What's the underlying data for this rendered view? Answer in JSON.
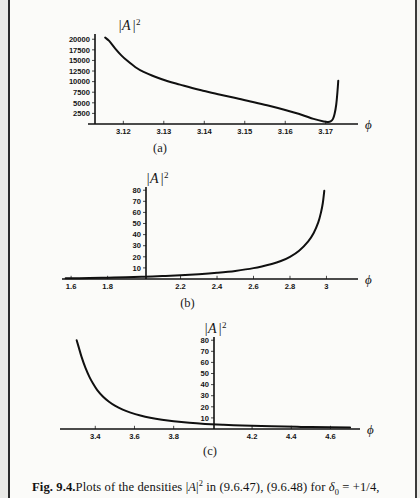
{
  "caption": {
    "figure_label": "Fig. 9.4.",
    "text_part1": "Plots of the densities ",
    "math_A": "A",
    "math_exp": "2",
    "text_part2": " in (9.6.47), (9.6.48) for ",
    "math_delta": "δ",
    "math_delta_sub": "0",
    "math_eq": " = +1/4,",
    "full_text": "Fig. 9.4. Plots of the densities |A|2 in (9.6.47), (9.6.48) for δ0 = +1/4,"
  },
  "subplots": [
    {
      "id": "a",
      "label": "(a)"
    },
    {
      "id": "b",
      "label": "(b)"
    },
    {
      "id": "c",
      "label": "(c)"
    }
  ],
  "axis_symbols": {
    "y_bar_left": "|",
    "y_A": "A",
    "y_bar_right": "|",
    "y_exponent": "2",
    "x_phi": "ϕ"
  },
  "chart_data": [
    {
      "type": "line",
      "id": "a",
      "title": "(a)",
      "xlabel": "ϕ",
      "ylabel": "|A|^2",
      "xlim": [
        3.113,
        3.176
      ],
      "ylim": [
        0,
        21000
      ],
      "xticks": [
        3.12,
        3.13,
        3.14,
        3.15,
        3.16,
        3.17
      ],
      "xtick_labels": [
        "3.12",
        "3.13",
        "3.14",
        "3.15",
        "3.16",
        "3.17"
      ],
      "yticks": [
        2500,
        5000,
        7500,
        10000,
        12500,
        15000,
        17500,
        20000
      ],
      "ytick_labels": [
        "2500",
        "5000",
        "7500",
        "10000",
        "12500",
        "15000",
        "17500",
        "20000"
      ],
      "grid": false,
      "legend": "none",
      "series": [
        {
          "name": "|A|^2 density",
          "x": [
            3.1155,
            3.1165,
            3.118,
            3.1195,
            3.121,
            3.123,
            3.125,
            3.128,
            3.131,
            3.134,
            3.137,
            3.14,
            3.144,
            3.148,
            3.152,
            3.156,
            3.16,
            3.164,
            3.167,
            3.1695,
            3.1705,
            3.1712,
            3.1718,
            3.1722,
            3.1726,
            3.1729,
            3.1731
          ],
          "y": [
            20400,
            19600,
            17800,
            16200,
            14900,
            13400,
            12300,
            11100,
            10100,
            9300,
            8500,
            7800,
            6900,
            6100,
            5200,
            4300,
            3300,
            2200,
            1200,
            600,
            500,
            600,
            1200,
            2400,
            4600,
            7600,
            10200
          ]
        }
      ]
    },
    {
      "type": "line",
      "id": "b",
      "title": "(b)",
      "xlabel": "ϕ",
      "ylabel": "|A|^2",
      "xlim": [
        1.55,
        3.14
      ],
      "ylim": [
        0,
        82
      ],
      "xticks": [
        1.6,
        1.8,
        2.2,
        2.4,
        2.6,
        2.8,
        3.0
      ],
      "xtick_labels": [
        "1.6",
        "1.8",
        "2.2",
        "2.4",
        "2.6",
        "2.8",
        "3"
      ],
      "yticks": [
        10,
        20,
        30,
        40,
        50,
        60,
        70,
        80
      ],
      "ytick_labels": [
        "10",
        "20",
        "30",
        "40",
        "50",
        "60",
        "70",
        "80"
      ],
      "grid": false,
      "legend": "none",
      "series": [
        {
          "name": "|A|^2 density",
          "x": [
            1.57,
            1.7,
            1.8,
            1.9,
            2.0,
            2.1,
            2.2,
            2.3,
            2.4,
            2.5,
            2.6,
            2.7,
            2.75,
            2.8,
            2.85,
            2.9,
            2.93,
            2.955,
            2.97,
            2.98,
            2.988
          ],
          "y": [
            0.6,
            0.9,
            1.2,
            1.5,
            2.0,
            2.6,
            3.3,
            4.3,
            5.6,
            7.3,
            9.8,
            13.6,
            16.2,
            20.0,
            25.5,
            34.0,
            41.5,
            51.0,
            60.0,
            68.5,
            79.5
          ]
        }
      ]
    },
    {
      "type": "line",
      "id": "c",
      "title": "(c)",
      "xlabel": "ϕ",
      "ylabel": "|A|^2",
      "xlim": [
        3.22,
        4.72
      ],
      "ylim": [
        0,
        82
      ],
      "xticks": [
        3.4,
        3.6,
        3.8,
        4.2,
        4.4,
        4.6
      ],
      "xtick_labels": [
        "3.4",
        "3.6",
        "3.8",
        "4.2",
        "4.4",
        "4.6"
      ],
      "yticks": [
        10,
        20,
        30,
        40,
        50,
        60,
        70,
        80
      ],
      "ytick_labels": [
        "10",
        "20",
        "30",
        "40",
        "50",
        "60",
        "70",
        "80"
      ],
      "grid": false,
      "legend": "none",
      "series": [
        {
          "name": "|A|^2 density",
          "x": [
            3.305,
            3.315,
            3.33,
            3.35,
            3.37,
            3.39,
            3.41,
            3.44,
            3.47,
            3.5,
            3.54,
            3.58,
            3.63,
            3.68,
            3.74,
            3.8,
            3.88,
            3.96,
            4.05,
            4.15,
            4.3,
            4.45,
            4.6,
            4.7
          ],
          "y": [
            80.0,
            74.0,
            65.0,
            55.0,
            47.0,
            40.5,
            35.0,
            29.0,
            24.5,
            21.0,
            17.5,
            14.8,
            12.2,
            10.2,
            8.4,
            7.0,
            5.6,
            4.6,
            3.8,
            3.1,
            2.4,
            1.9,
            1.5,
            1.3
          ]
        }
      ]
    }
  ]
}
